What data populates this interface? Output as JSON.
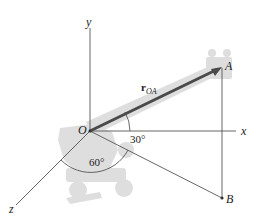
{
  "diagram": {
    "type": "3d-position-vector",
    "axes": {
      "x_label": "x",
      "y_label": "y",
      "z_label": "z"
    },
    "points": {
      "origin": "O",
      "a": "A",
      "b": "B"
    },
    "vector": {
      "symbol": "r",
      "subscript": "OA"
    },
    "angles": {
      "elevation": "30°",
      "azimuth": "60°"
    },
    "colors": {
      "axis": "#555555",
      "vector": "#4a4a4a",
      "silhouette": "#dcdcdc",
      "text": "#222222"
    }
  }
}
